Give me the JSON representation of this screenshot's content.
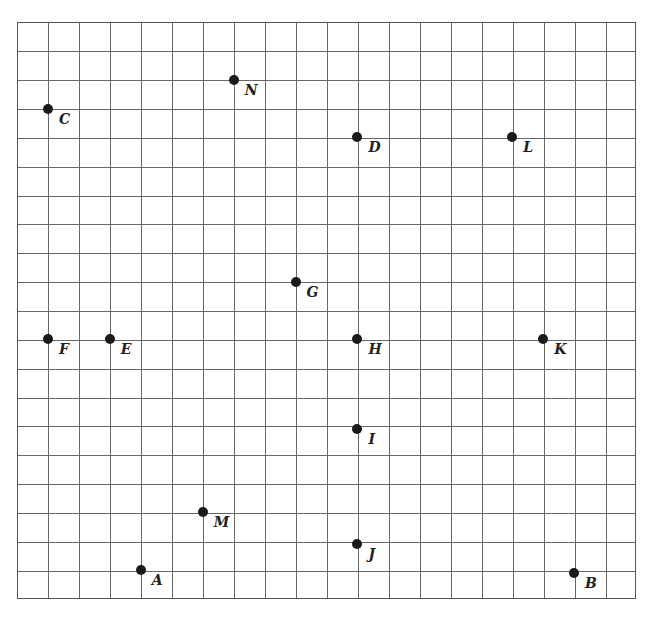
{
  "diagram": {
    "type": "coordinate-grid",
    "columns": 20,
    "rows": 20,
    "colors": {
      "grid": "#666666",
      "point": "#1a1a1a",
      "label": "#222222",
      "background": "#ffffff"
    }
  },
  "points": [
    {
      "label": "A",
      "col": 4,
      "row": 19
    },
    {
      "label": "B",
      "col": 18,
      "row": 19.1
    },
    {
      "label": "C",
      "col": 1,
      "row": 3
    },
    {
      "label": "D",
      "col": 11,
      "row": 4
    },
    {
      "label": "E",
      "col": 3,
      "row": 11
    },
    {
      "label": "F",
      "col": 1,
      "row": 11
    },
    {
      "label": "G",
      "col": 9,
      "row": 9
    },
    {
      "label": "H",
      "col": 11,
      "row": 11
    },
    {
      "label": "I",
      "col": 11,
      "row": 14.1
    },
    {
      "label": "J",
      "col": 11,
      "row": 18.1
    },
    {
      "label": "K",
      "col": 17,
      "row": 11
    },
    {
      "label": "L",
      "col": 16,
      "row": 4
    },
    {
      "label": "M",
      "col": 6,
      "row": 17
    },
    {
      "label": "N",
      "col": 7,
      "row": 2
    }
  ]
}
